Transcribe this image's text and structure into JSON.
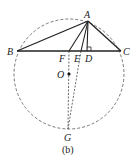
{
  "figure": {
    "caption": "(b)",
    "circle": {
      "cx": 69,
      "cy": 74,
      "r": 55,
      "style": "dashed"
    },
    "points": {
      "A": {
        "label": "A",
        "x": 88,
        "y": 21
      },
      "B": {
        "label": "B",
        "x": 17,
        "y": 51
      },
      "C": {
        "label": "C",
        "x": 121,
        "y": 51
      },
      "F": {
        "label": "F",
        "x": 69,
        "y": 51
      },
      "E": {
        "label": "E",
        "x": 81,
        "y": 51
      },
      "D": {
        "label": "D",
        "x": 87,
        "y": 51
      },
      "O": {
        "label": "O",
        "x": 69,
        "y": 74
      },
      "G": {
        "label": "G",
        "x": 68,
        "y": 129
      }
    },
    "segments_solid": [
      "AB",
      "AC",
      "BC",
      "AF",
      "AE",
      "AD"
    ],
    "segments_dashed": [
      "FG",
      "EG"
    ],
    "right_angle_at": "D"
  }
}
